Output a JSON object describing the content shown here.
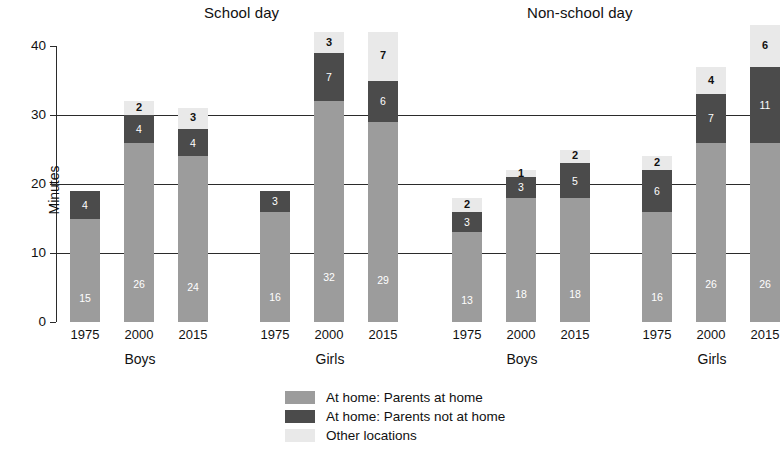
{
  "chart_data": {
    "type": "bar",
    "subtype": "stacked",
    "title": "",
    "panels": [
      {
        "title": "School day",
        "groups": [
          {
            "label": "Boys",
            "categories": [
              "1975",
              "2000",
              "2015"
            ],
            "bars": [
              {
                "category": "1975",
                "segments": [
                  {
                    "series": "At home: Parents at home",
                    "value": 15
                  },
                  {
                    "series": "At home: Parents not at home",
                    "value": 4
                  },
                  {
                    "series": "Other locations",
                    "value": 0
                  }
                ],
                "total": 19
              },
              {
                "category": "2000",
                "segments": [
                  {
                    "series": "At home: Parents at home",
                    "value": 26
                  },
                  {
                    "series": "At home: Parents not at home",
                    "value": 4
                  },
                  {
                    "series": "Other locations",
                    "value": 2
                  }
                ],
                "total": 32
              },
              {
                "category": "2015",
                "segments": [
                  {
                    "series": "At home: Parents at home",
                    "value": 24
                  },
                  {
                    "series": "At home: Parents not at home",
                    "value": 4
                  },
                  {
                    "series": "Other locations",
                    "value": 3
                  }
                ],
                "total": 31
              }
            ]
          },
          {
            "label": "Girls",
            "categories": [
              "1975",
              "2000",
              "2015"
            ],
            "bars": [
              {
                "category": "1975",
                "segments": [
                  {
                    "series": "At home: Parents at home",
                    "value": 16
                  },
                  {
                    "series": "At home: Parents not at home",
                    "value": 3
                  },
                  {
                    "series": "Other locations",
                    "value": 0
                  }
                ],
                "total": 19
              },
              {
                "category": "2000",
                "segments": [
                  {
                    "series": "At home: Parents at home",
                    "value": 32
                  },
                  {
                    "series": "At home: Parents not at home",
                    "value": 7
                  },
                  {
                    "series": "Other locations",
                    "value": 3
                  }
                ],
                "total": 42
              },
              {
                "category": "2015",
                "segments": [
                  {
                    "series": "At home: Parents at home",
                    "value": 29
                  },
                  {
                    "series": "At home: Parents not at home",
                    "value": 6
                  },
                  {
                    "series": "Other locations",
                    "value": 7
                  }
                ],
                "total": 42
              }
            ]
          }
        ]
      },
      {
        "title": "Non-school day",
        "groups": [
          {
            "label": "Boys",
            "categories": [
              "1975",
              "2000",
              "2015"
            ],
            "bars": [
              {
                "category": "1975",
                "segments": [
                  {
                    "series": "At home: Parents at home",
                    "value": 13
                  },
                  {
                    "series": "At home: Parents not at home",
                    "value": 3
                  },
                  {
                    "series": "Other locations",
                    "value": 2
                  }
                ],
                "total": 18
              },
              {
                "category": "2000",
                "segments": [
                  {
                    "series": "At home: Parents at home",
                    "value": 18
                  },
                  {
                    "series": "At home: Parents not at home",
                    "value": 3
                  },
                  {
                    "series": "Other locations",
                    "value": 1
                  }
                ],
                "total": 22
              },
              {
                "category": "2015",
                "segments": [
                  {
                    "series": "At home: Parents at home",
                    "value": 18
                  },
                  {
                    "series": "At home: Parents not at home",
                    "value": 5
                  },
                  {
                    "series": "Other locations",
                    "value": 2
                  }
                ],
                "total": 25
              }
            ]
          },
          {
            "label": "Girls",
            "categories": [
              "1975",
              "2000",
              "2015"
            ],
            "bars": [
              {
                "category": "1975",
                "segments": [
                  {
                    "series": "At home: Parents at home",
                    "value": 16
                  },
                  {
                    "series": "At home: Parents not at home",
                    "value": 6
                  },
                  {
                    "series": "Other locations",
                    "value": 2
                  }
                ],
                "total": 24
              },
              {
                "category": "2000",
                "segments": [
                  {
                    "series": "At home: Parents at home",
                    "value": 26
                  },
                  {
                    "series": "At home: Parents not at home",
                    "value": 7
                  },
                  {
                    "series": "Other locations",
                    "value": 4
                  }
                ],
                "total": 37
              },
              {
                "category": "2015",
                "segments": [
                  {
                    "series": "At home: Parents at home",
                    "value": 26
                  },
                  {
                    "series": "At home: Parents not at home",
                    "value": 11
                  },
                  {
                    "series": "Other locations",
                    "value": 6
                  }
                ],
                "total": 43
              }
            ]
          }
        ]
      }
    ],
    "ylabel": "Minutes",
    "xlabel": "",
    "ylim": [
      0,
      40
    ],
    "yticks": [
      0,
      10,
      20,
      30,
      40
    ],
    "grid": true,
    "grid_axis": "y",
    "legend_position": "bottom-center",
    "series": [
      {
        "name": "At home: Parents at home",
        "color": "#9c9c9c"
      },
      {
        "name": "At home: Parents not at home",
        "color": "#4b4b4b"
      },
      {
        "name": "Other locations",
        "color": "#e9e9e9"
      }
    ]
  },
  "legend": {
    "items": [
      {
        "label": "At home: Parents at home",
        "color": "#9c9c9c"
      },
      {
        "label": "At home: Parents not at home",
        "color": "#4b4b4b"
      },
      {
        "label": "Other locations",
        "color": "#e9e9e9"
      }
    ]
  }
}
